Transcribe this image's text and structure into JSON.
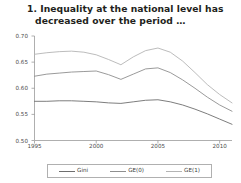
{
  "chart_data": {
    "type": "line",
    "title": "1. Inequality at the national level has decreased over the period …",
    "xlabel": "",
    "ylabel": "",
    "xlim": [
      1995,
      2011
    ],
    "ylim": [
      0.5,
      0.7
    ],
    "grid": false,
    "legend_position": "bottom",
    "x_ticks": [
      "1995",
      "2000",
      "2005",
      "2010"
    ],
    "x_tick_values": [
      1995,
      2000,
      2005,
      2010
    ],
    "y_ticks": [
      "0.70",
      "0.65",
      "0.60",
      "0.55",
      "0.50"
    ],
    "y_tick_values": [
      0.7,
      0.65,
      0.6,
      0.55,
      0.5
    ],
    "x": [
      1995,
      1996,
      1997,
      1998,
      1999,
      2000,
      2001,
      2002,
      2003,
      2004,
      2005,
      2006,
      2007,
      2008,
      2009,
      2010,
      2011
    ],
    "series": [
      {
        "name": "Gini",
        "color": "#6e6e6e",
        "values": [
          0.575,
          0.575,
          0.576,
          0.576,
          0.575,
          0.574,
          0.572,
          0.571,
          0.574,
          0.577,
          0.578,
          0.574,
          0.568,
          0.56,
          0.551,
          0.541,
          0.531
        ]
      },
      {
        "name": "GE(0)",
        "color": "#8f8f8f",
        "values": [
          0.623,
          0.627,
          0.629,
          0.631,
          0.632,
          0.633,
          0.626,
          0.617,
          0.627,
          0.637,
          0.639,
          0.63,
          0.616,
          0.6,
          0.583,
          0.568,
          0.556
        ]
      },
      {
        "name": "GE(1)",
        "color": "#b4b4b4",
        "values": [
          0.665,
          0.668,
          0.67,
          0.671,
          0.669,
          0.664,
          0.655,
          0.645,
          0.66,
          0.672,
          0.677,
          0.669,
          0.652,
          0.63,
          0.607,
          0.588,
          0.572
        ]
      }
    ]
  }
}
